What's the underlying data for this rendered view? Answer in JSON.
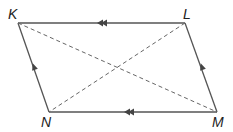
{
  "figure": {
    "type": "parallelogram",
    "vertices": [
      {
        "name": "K",
        "label": "K"
      },
      {
        "name": "L",
        "label": "L"
      },
      {
        "name": "M",
        "label": "M"
      },
      {
        "name": "N",
        "label": "N"
      }
    ],
    "sides": [
      {
        "from": "K",
        "to": "L",
        "style": "solid",
        "marker": "double-arrow"
      },
      {
        "from": "L",
        "to": "M",
        "style": "solid",
        "marker": "single-arrow"
      },
      {
        "from": "M",
        "to": "N",
        "style": "solid",
        "marker": "double-arrow"
      },
      {
        "from": "N",
        "to": "K",
        "style": "solid",
        "marker": "single-arrow"
      }
    ],
    "diagonals": [
      {
        "from": "K",
        "to": "M",
        "style": "dashed"
      },
      {
        "from": "L",
        "to": "N",
        "style": "dashed"
      }
    ]
  }
}
